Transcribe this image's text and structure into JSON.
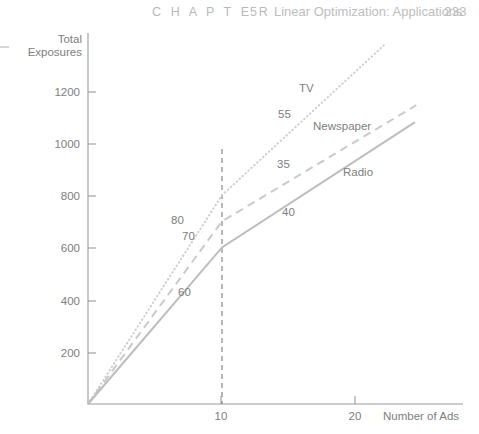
{
  "running_head": {
    "chapter_word": "C H A P T E R",
    "chapter_number": "5",
    "title": "Linear Optimization: Applications",
    "page_number": "233"
  },
  "chart_data": {
    "type": "line",
    "title": "",
    "xlabel": "Number of Ads",
    "ylabel": "Total Exposures",
    "xlim": [
      0,
      27
    ],
    "ylim": [
      0,
      1420
    ],
    "xticks": [
      10,
      20
    ],
    "xticklabels": [
      "10",
      "20"
    ],
    "yticks": [
      200,
      400,
      600,
      800,
      1000,
      1200
    ],
    "yticklabels": [
      "200",
      "400",
      "600",
      "800",
      "1000",
      "1200"
    ],
    "grid": false,
    "legend": "inline-annotations",
    "reference_lines": [
      {
        "name": "breakpoint-at-10-ads",
        "orientation": "vertical",
        "x": 10,
        "style": "dashed"
      }
    ],
    "series": [
      {
        "name": "TV",
        "style": "dotted",
        "color": "#cfcfcf",
        "points": [
          {
            "x": 0,
            "y": 0
          },
          {
            "x": 10,
            "y": 800
          },
          {
            "x": 22.2,
            "y": 1380
          }
        ],
        "slopes": [
          {
            "label": "80",
            "segment": 1
          },
          {
            "label": "55",
            "segment": 2
          }
        ]
      },
      {
        "name": "Newspaper",
        "style": "dashed",
        "color": "#cacaca",
        "points": [
          {
            "x": 0,
            "y": 0
          },
          {
            "x": 10,
            "y": 700
          },
          {
            "x": 24.5,
            "y": 1145
          }
        ],
        "slopes": [
          {
            "label": "70",
            "segment": 1
          },
          {
            "label": "35",
            "segment": 2
          }
        ]
      },
      {
        "name": "Radio",
        "style": "solid",
        "color": "#bdbdbd",
        "points": [
          {
            "x": 0,
            "y": 0
          },
          {
            "x": 10,
            "y": 600
          },
          {
            "x": 24.4,
            "y": 1080
          }
        ],
        "slopes": [
          {
            "label": "60",
            "segment": 1
          },
          {
            "label": "40",
            "segment": 2
          }
        ]
      }
    ],
    "series_labels": [
      {
        "text": "TV",
        "x_px": 299,
        "y_px": 88
      },
      {
        "text": "Newspaper",
        "x_px": 313,
        "y_px": 126
      },
      {
        "text": "Radio",
        "x_px": 343,
        "y_px": 172
      }
    ],
    "slope_labels": [
      {
        "text": "55",
        "x_px": 285,
        "y_px": 114
      },
      {
        "text": "35",
        "x_px": 284,
        "y_px": 164
      },
      {
        "text": "80",
        "x_px": 175,
        "y_px": 220
      },
      {
        "text": "70",
        "x_px": 186,
        "y_px": 235
      },
      {
        "text": "40",
        "x_px": 288,
        "y_px": 212
      },
      {
        "text": "60",
        "x_px": 182,
        "y_px": 292
      }
    ]
  }
}
